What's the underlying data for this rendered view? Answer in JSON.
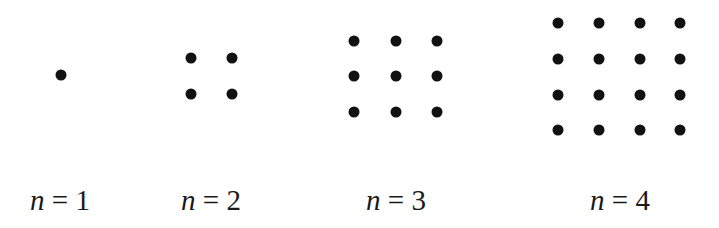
{
  "figure": {
    "dot_color": "#111111",
    "panels": [
      {
        "n": 1,
        "label_var": "n",
        "label_eq": " = ",
        "label_val": "1",
        "label_cx": 60,
        "xs": [
          61
        ],
        "ys": [
          75
        ]
      },
      {
        "n": 2,
        "label_var": "n",
        "label_eq": " = ",
        "label_val": "2",
        "label_cx": 211,
        "xs": [
          191,
          232
        ],
        "ys": [
          58,
          94
        ]
      },
      {
        "n": 3,
        "label_var": "n",
        "label_eq": " = ",
        "label_val": "3",
        "label_cx": 396,
        "xs": [
          354,
          396,
          437
        ],
        "ys": [
          41,
          76,
          112
        ]
      },
      {
        "n": 4,
        "label_var": "n",
        "label_eq": " = ",
        "label_val": "4",
        "label_cx": 620,
        "xs": [
          558,
          599,
          640,
          680
        ],
        "ys": [
          23,
          59,
          95,
          130
        ]
      }
    ]
  }
}
